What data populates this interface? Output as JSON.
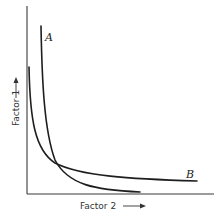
{
  "figure": {
    "type": "diagram",
    "x_axis": {
      "label": "Factor 2",
      "arrow": "right-arrow"
    },
    "y_axis": {
      "label": "Factor 1",
      "arrow": "up-arrow"
    },
    "curves": [
      {
        "id": "A",
        "label": "A",
        "shape": "steep hyperbola-like decline"
      },
      {
        "id": "B",
        "label": "B",
        "shape": "shallower hyperbola-like decline"
      }
    ],
    "colors": {
      "axis": "#3a3a3a",
      "curve": "#1e1e1e",
      "text": "#333333",
      "background": "#ffffff"
    }
  }
}
